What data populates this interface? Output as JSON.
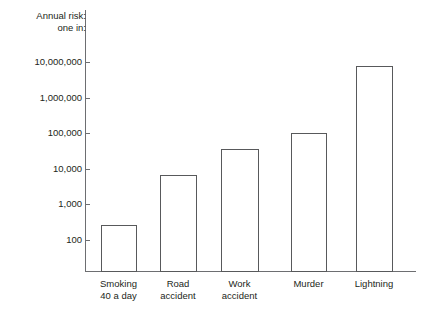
{
  "chart_data": {
    "type": "bar",
    "title": "",
    "ylabel_lines": [
      "Annual risk:",
      "one in:"
    ],
    "xlabel": "",
    "yscale": "log",
    "ylim": [
      30,
      30000000
    ],
    "grid": false,
    "legend": null,
    "axis_color": "#6d6e71",
    "bar_edge_color": "#58595b",
    "bar_fill_color": "#ffffff",
    "yticks": [
      100,
      1000,
      10000,
      100000,
      1000000,
      10000000
    ],
    "ytick_labels": [
      "100",
      "1,000",
      "10,000",
      "100,000",
      "1,000,000",
      "10,000,000"
    ],
    "categories": [
      {
        "label_lines": [
          "Smoking",
          "40 a day"
        ],
        "name": "Smoking 40 a day"
      },
      {
        "label_lines": [
          "Road",
          "accident"
        ],
        "name": "Road accident"
      },
      {
        "label_lines": [
          "Work",
          "accident"
        ],
        "name": "Work accident"
      },
      {
        "label_lines": [
          "Murder"
        ],
        "name": "Murder"
      },
      {
        "label_lines": [
          "Lightning"
        ],
        "name": "Lightning"
      }
    ],
    "values": [
      260,
      6800,
      37000,
      100000,
      7500000
    ],
    "value_labels": [
      "260",
      "6,800",
      "37,000",
      "100,000",
      "7,500,000"
    ]
  },
  "figure": {
    "caption": ""
  }
}
